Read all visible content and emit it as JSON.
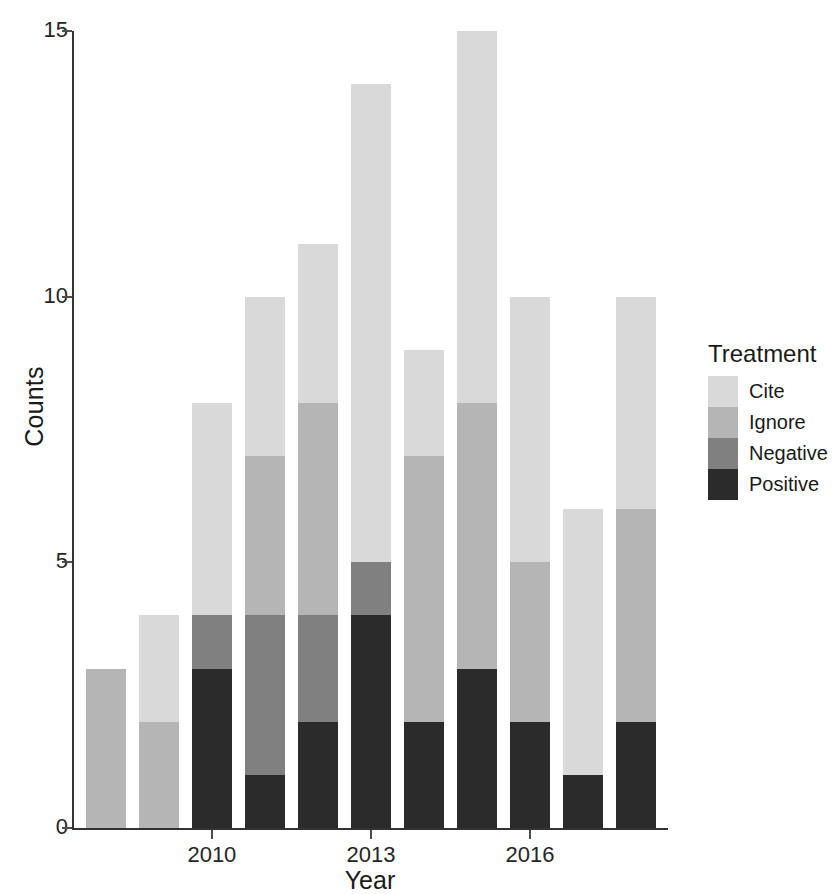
{
  "chart_data": {
    "type": "bar",
    "title": "",
    "subtitle": "",
    "xlabel": "Year",
    "ylabel": "Counts",
    "stacked": true,
    "orientation": "vertical",
    "grid": false,
    "categories": [
      2008,
      2009,
      2010,
      2011,
      2012,
      2013,
      2014,
      2015,
      2016,
      2017,
      2018
    ],
    "x_tick_labels": [
      "2010",
      "2013",
      "2016"
    ],
    "x_tick_values": [
      2010,
      2013,
      2016
    ],
    "y_tick_labels": [
      "0",
      "5",
      "10",
      "15"
    ],
    "y_tick_values": [
      0,
      5,
      10,
      15
    ],
    "ylim": [
      0,
      15
    ],
    "xlim": [
      2007.4,
      2018.6
    ],
    "legend": {
      "title": "Treatment",
      "position": "right",
      "entries": [
        "Cite",
        "Ignore",
        "Negative",
        "Positive"
      ]
    },
    "series": [
      {
        "name": "Positive",
        "color": "#2b2b2b",
        "values": [
          0,
          0,
          3,
          1,
          2,
          4,
          2,
          3,
          2,
          1,
          2
        ]
      },
      {
        "name": "Negative",
        "color": "#808080",
        "values": [
          0,
          0,
          1,
          3,
          2,
          1,
          0,
          0,
          0,
          0,
          0
        ]
      },
      {
        "name": "Ignore",
        "color": "#b5b5b5",
        "values": [
          3,
          2,
          0,
          3,
          4,
          0,
          5,
          5,
          3,
          0,
          4
        ]
      },
      {
        "name": "Cite",
        "color": "#d9d9d9",
        "values": [
          0,
          2,
          4,
          3,
          3,
          9,
          2,
          7,
          5,
          5,
          4
        ]
      }
    ],
    "stack_order_bottom_to_top": [
      "Positive",
      "Negative",
      "Ignore",
      "Cite"
    ],
    "totals": [
      3,
      4,
      8,
      10,
      11,
      14,
      9,
      15,
      10,
      6,
      10
    ],
    "colors": {
      "Cite": "#d9d9d9",
      "Ignore": "#b5b5b5",
      "Negative": "#808080",
      "Positive": "#2b2b2b",
      "axis": "#333333",
      "text": "#1a1a1a",
      "background": "#ffffff"
    }
  }
}
